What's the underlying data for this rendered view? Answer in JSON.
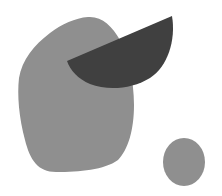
{
  "canvas": {
    "width": 222,
    "height": 196,
    "background": "#ffffff"
  },
  "shapes": {
    "large_blob": {
      "label": "large-gray-blob",
      "color": "#8f8f8f"
    },
    "half_moon": {
      "label": "dark-half-moon",
      "color": "#404040"
    },
    "small_circle": {
      "label": "small-gray-circle",
      "color": "#8f8f8f"
    }
  }
}
